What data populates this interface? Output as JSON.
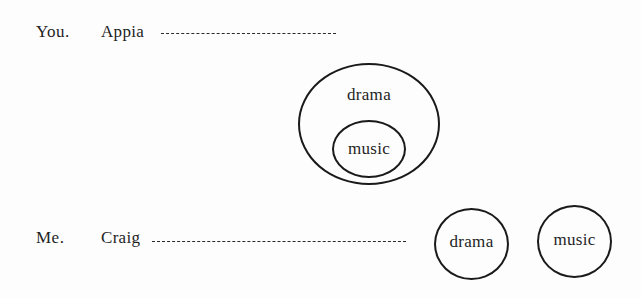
{
  "diagram": {
    "background_color": "#fdfdfd",
    "stroke_color": "#1a1a1a",
    "text_color": "#1f1f1f",
    "rows": [
      {
        "speaker": "You.",
        "name": "Appia",
        "connector": "dashed-line"
      },
      {
        "speaker": "Me.",
        "name": "Craig",
        "connector": "dashed-line"
      }
    ],
    "top_diagram": {
      "type": "nested-circles",
      "outer_label": "drama",
      "inner_label": "music"
    },
    "bottom_diagram": {
      "type": "separate-circles",
      "left_label": "drama",
      "right_label": "music"
    }
  }
}
